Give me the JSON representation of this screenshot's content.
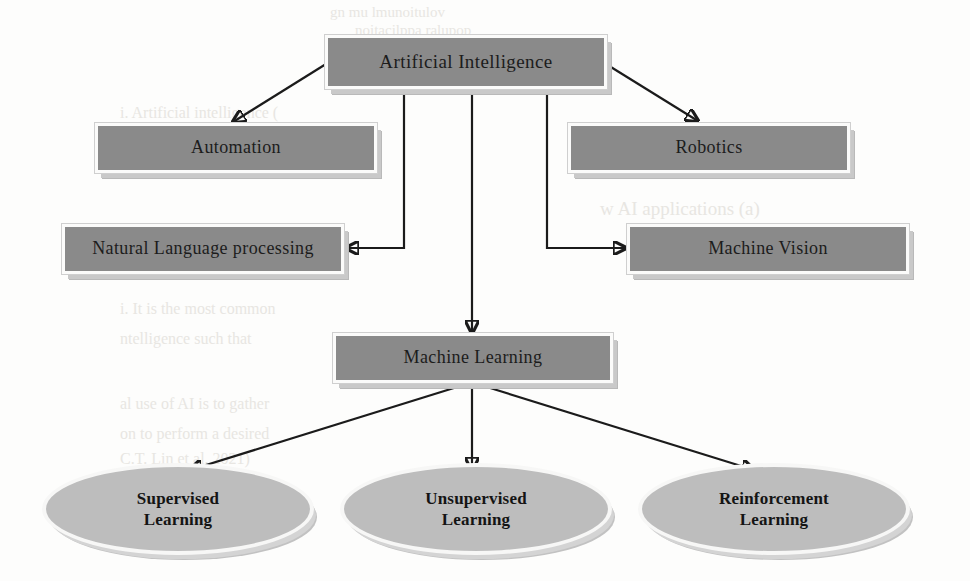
{
  "diagram": {
    "title_node": {
      "id": "artificial-intelligence",
      "label": "Artificial Intelligence"
    },
    "branch_nodes": [
      {
        "id": "automation",
        "label": "Automation"
      },
      {
        "id": "robotics",
        "label": "Robotics"
      },
      {
        "id": "natural-language-processing",
        "label": "Natural Language processing"
      },
      {
        "id": "machine-vision",
        "label": "Machine Vision"
      },
      {
        "id": "machine-learning",
        "label": "Machine Learning"
      }
    ],
    "leaf_nodes": [
      {
        "id": "supervised-learning",
        "line1": "Supervised",
        "line2": "Learning"
      },
      {
        "id": "unsupervised-learning",
        "line1": "Unsupervised",
        "line2": "Learning"
      },
      {
        "id": "reinforcement-learning",
        "line1": "Reinforcement",
        "line2": "Learning"
      }
    ],
    "edges": [
      {
        "from": "artificial-intelligence",
        "to": "automation",
        "style": "diagonal-arrow"
      },
      {
        "from": "artificial-intelligence",
        "to": "robotics",
        "style": "diagonal-arrow"
      },
      {
        "from": "artificial-intelligence",
        "to": "natural-language-processing",
        "style": "elbow-arrow"
      },
      {
        "from": "artificial-intelligence",
        "to": "machine-vision",
        "style": "elbow-arrow"
      },
      {
        "from": "artificial-intelligence",
        "to": "machine-learning",
        "style": "straight-arrow"
      },
      {
        "from": "machine-learning",
        "to": "supervised-learning",
        "style": "diagonal-arrow"
      },
      {
        "from": "machine-learning",
        "to": "unsupervised-learning",
        "style": "straight-arrow"
      },
      {
        "from": "machine-learning",
        "to": "reinforcement-learning",
        "style": "diagonal-arrow"
      }
    ],
    "colors": {
      "node_fill": "#8a8a8a",
      "ellipse_fill": "#bdbdbd",
      "node_border": "#fbfbfa",
      "shadow": "#c9c9c9",
      "connector": "#1b1b1b",
      "background": "#fdfdfc",
      "text": "#1c1c1c"
    }
  },
  "background_ghost_text": {
    "line1": "gn mu lmunoitulov",
    "line2": "noitacilppa ralupop",
    "line3": "i. Artificial intelligence (",
    "line4": "how AI applications a",
    "line5": "w AI applications (a)",
    "line6": "i. It is the most common",
    "line7": "ntelligence such that",
    "line8": "al use of AI is to gather",
    "line9": "on to perform a desired",
    "line10": "C.T. Lin et al. 2021)"
  }
}
